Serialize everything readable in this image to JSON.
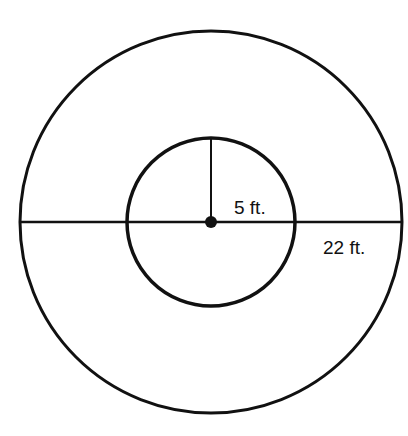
{
  "diagram": {
    "type": "concentric-circles",
    "stroke_color": "#111111",
    "background": "#ffffff",
    "outer_circle": {
      "cx": 211,
      "cy": 222,
      "r": 191,
      "label": "22 ft."
    },
    "inner_circle": {
      "cx": 211,
      "cy": 222,
      "r": 84,
      "label": "5 ft."
    },
    "diameter_line": {
      "x1": 20,
      "y1": 222,
      "x2": 402,
      "y2": 222
    },
    "radius_line": {
      "x1": 211,
      "y1": 138,
      "x2": 211,
      "y2": 222
    },
    "center_point": {
      "cx": 211,
      "cy": 222,
      "r": 6
    }
  }
}
